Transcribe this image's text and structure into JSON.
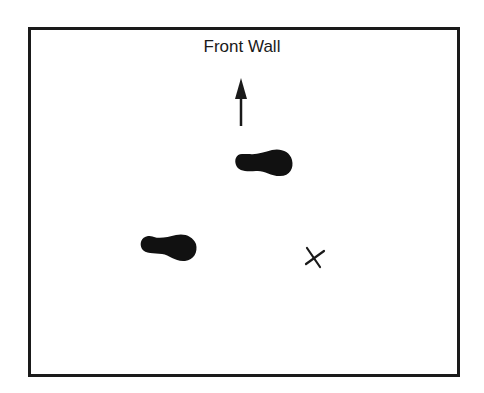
{
  "diagram": {
    "label": "Front Wall",
    "elements": [
      {
        "type": "frame",
        "name": "room-outline"
      },
      {
        "type": "arrow",
        "direction": "up",
        "name": "front-direction-arrow"
      },
      {
        "type": "footprint",
        "position": "upper-center",
        "name": "footprint-upper"
      },
      {
        "type": "footprint",
        "position": "lower-left",
        "name": "footprint-lower"
      },
      {
        "type": "x-mark",
        "position": "lower-right",
        "name": "target-x-mark"
      }
    ],
    "colors": {
      "ink": "#1a1a1a",
      "background": "#ffffff"
    }
  }
}
